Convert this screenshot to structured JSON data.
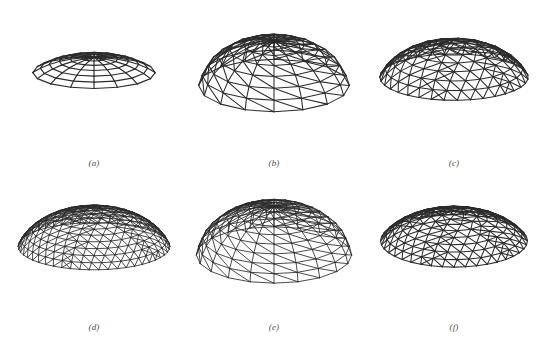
{
  "figure": {
    "type": "wireframe-mesh-comparison",
    "background_color": "#ffffff",
    "line_color": "#2b2b2b",
    "caption_color": "#4a4a4a",
    "panel_count": 6,
    "rows": 2,
    "columns": 3
  },
  "panels": [
    {
      "id": "a",
      "caption": "(a)",
      "mesh_kind": "radial-quadrilateral",
      "sectors": 16,
      "rings": 6,
      "cap_fraction": 0.62,
      "tilt_deg": 64,
      "height_scale": 0.52,
      "line_width": 1.15,
      "radius_x": 74,
      "radius_y": 44,
      "center_x": 88,
      "center_y": 88,
      "triangulate": false,
      "geodesic": false
    },
    {
      "id": "b",
      "caption": "(b)",
      "mesh_kind": "radial-triangulated",
      "sectors": 16,
      "rings": 7,
      "cap_fraction": 0.92,
      "tilt_deg": 58,
      "height_scale": 0.8,
      "line_width": 1.05,
      "radius_x": 76,
      "radius_y": 50,
      "center_x": 88,
      "center_y": 92,
      "triangulate": true,
      "geodesic": false
    },
    {
      "id": "c",
      "caption": "(c)",
      "mesh_kind": "geodesic-triangulated",
      "frequency": 7,
      "cap_fraction": 0.8,
      "tilt_deg": 62,
      "height_scale": 0.7,
      "line_width": 1.05,
      "radius_x": 78,
      "radius_y": 52,
      "center_x": 88,
      "center_y": 90,
      "triangulate": true,
      "geodesic": true
    },
    {
      "id": "d",
      "caption": "(d)",
      "mesh_kind": "geodesic-triangulated-fine",
      "frequency": 10,
      "cap_fraction": 0.82,
      "tilt_deg": 63,
      "height_scale": 0.7,
      "line_width": 0.85,
      "radius_x": 79,
      "radius_y": 54,
      "center_x": 88,
      "center_y": 88,
      "triangulate": true,
      "geodesic": true
    },
    {
      "id": "e",
      "caption": "(e)",
      "mesh_kind": "radial-triangulated-fine",
      "sectors": 20,
      "rings": 9,
      "cap_fraction": 0.94,
      "tilt_deg": 57,
      "height_scale": 0.82,
      "line_width": 0.85,
      "radius_x": 78,
      "radius_y": 52,
      "center_x": 88,
      "center_y": 90,
      "triangulate": true,
      "geodesic": false
    },
    {
      "id": "f",
      "caption": "(f)",
      "mesh_kind": "geodesic-triangulated-coarse",
      "frequency": 8,
      "cap_fraction": 0.74,
      "tilt_deg": 55,
      "height_scale": 0.66,
      "line_width": 1.05,
      "radius_x": 80,
      "radius_y": 50,
      "center_x": 88,
      "center_y": 86,
      "triangulate": true,
      "geodesic": true
    }
  ]
}
